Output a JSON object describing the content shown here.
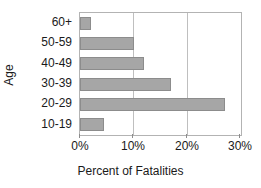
{
  "chart_data": {
    "type": "bar",
    "orientation": "horizontal",
    "title": "",
    "xlabel": "Percent of Fatalities",
    "ylabel": "Age",
    "categories": [
      "10-19",
      "20-29",
      "30-39",
      "40-49",
      "50-59",
      "60+"
    ],
    "values": [
      4.5,
      27,
      17,
      12,
      10,
      2
    ],
    "xlim": [
      0,
      30
    ],
    "xticks": [
      0,
      10,
      20,
      30
    ],
    "xticklabels": [
      "0%",
      "10%",
      "20%",
      "30%"
    ],
    "grid": "vertical",
    "legend": "none",
    "bar_color": "#a6a6a6",
    "bar_edge_color": "#8c8c8c",
    "axis_color": "#b3b3b3",
    "gridline_color": "#bfbfbf",
    "text_color": "#1a1a1a",
    "bars_top_to_bottom": [
      {
        "category": "60+",
        "value": 2
      },
      {
        "category": "50-59",
        "value": 10
      },
      {
        "category": "40-49",
        "value": 12
      },
      {
        "category": "30-39",
        "value": 17
      },
      {
        "category": "20-29",
        "value": 27
      },
      {
        "category": "10-19",
        "value": 4.5
      }
    ]
  }
}
